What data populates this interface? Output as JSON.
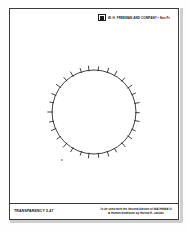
{
  "page": {
    "background_color": "#fefefe",
    "border_color": "#3b3b3b"
  },
  "header": {
    "logo_icon": "publisher-square-logo",
    "publisher_line": "W. H. FREEMAN AND COMPANY  •  San Francisco"
  },
  "figure": {
    "stroke_color": "#2b2b2b"
  },
  "footer": {
    "transparency_label": "TRANSPARENCY 5-47",
    "credit_line_1": "To be used with the Second Edition of MATHEMATICS",
    "credit_line_2": "A Human Endeavor by Harold R. Jacobs"
  },
  "chart_data": {
    "type": "scatter",
    "xlabel": "",
    "ylabel": "",
    "center": [
      94,
      112
    ],
    "radius": 42,
    "tick_count": 30,
    "tick_length": 4,
    "tick_angles_deg": [
      0,
      12,
      24,
      36,
      48,
      60,
      72,
      84,
      96,
      108,
      120,
      132,
      144,
      156,
      168,
      180,
      192,
      204,
      216,
      228,
      240,
      252,
      264,
      276,
      288,
      300,
      312,
      324,
      336,
      348
    ],
    "stray_point": [
      62,
      160
    ],
    "grid": false,
    "legend": false
  }
}
